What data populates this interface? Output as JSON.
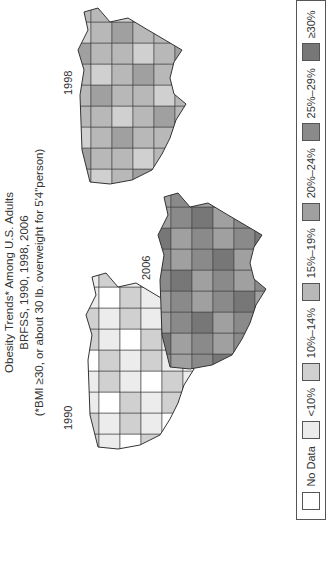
{
  "title": {
    "line1": "Obesity Trends* Among U.S. Adults",
    "line2": "BRFSS, 1990, 1998, 2006",
    "line3": "(*BMI ≥30, or about 30 lb. overweight for 5'4\"person)"
  },
  "maps": [
    {
      "year": "1990",
      "dominant_category": "10%–14%"
    },
    {
      "year": "1998",
      "dominant_category": "15%–19%"
    },
    {
      "year": "2006",
      "dominant_category": "25%–29%"
    }
  ],
  "legend": {
    "items": [
      {
        "label": "No Data",
        "color": "#ffffff"
      },
      {
        "label": "<10%",
        "color": "#ececec"
      },
      {
        "label": "10%–14%",
        "color": "#d0d0d0"
      },
      {
        "label": "15%–19%",
        "color": "#b8b8b8"
      },
      {
        "label": "20%–24%",
        "color": "#a0a0a0"
      },
      {
        "label": "25%–29%",
        "color": "#8a8a8a"
      },
      {
        "label": "≥30%",
        "color": "#777777"
      }
    ]
  }
}
